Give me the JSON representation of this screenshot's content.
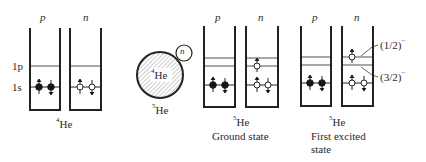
{
  "columns": {
    "p": "p",
    "n": "n"
  },
  "levels": {
    "one_p": "1p",
    "one_s": "1s"
  },
  "he4": {
    "mass": "4",
    "symbol": "He"
  },
  "core": {
    "mass": "4",
    "symbol": "He",
    "extra_neutron": "n"
  },
  "he5_core_label": {
    "mass": "5",
    "symbol": "He"
  },
  "ground": {
    "mass": "5",
    "symbol": "He",
    "caption": "Ground state"
  },
  "excited": {
    "mass": "5",
    "symbol": "He",
    "caption_line1": "First excited",
    "caption_line2": "state",
    "level_upper": "(1/2)",
    "level_lower": "(3/2)",
    "parity": "−"
  }
}
